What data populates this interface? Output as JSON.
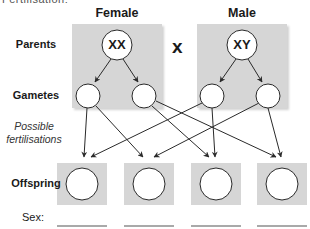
{
  "top_fragment": "Fertilisation:",
  "columns": {
    "female": "Female",
    "male": "Male"
  },
  "cross_symbol": "x",
  "rows": {
    "parents": "Parents",
    "gametes": "Gametes",
    "fertilisations_line1": "Possible",
    "fertilisations_line2": "fertilisations",
    "offspring": "Offspring",
    "sex": "Sex:"
  },
  "parents": {
    "female_genotype": "XX",
    "male_genotype": "XY"
  },
  "gametes": [
    {
      "id": "female-gamete-1",
      "label": ""
    },
    {
      "id": "female-gamete-2",
      "label": ""
    },
    {
      "id": "male-gamete-1",
      "label": ""
    },
    {
      "id": "male-gamete-2",
      "label": ""
    }
  ],
  "offspring": [
    {
      "id": "offspring-1",
      "label": "",
      "sex": ""
    },
    {
      "id": "offspring-2",
      "label": "",
      "sex": ""
    },
    {
      "id": "offspring-3",
      "label": "",
      "sex": ""
    },
    {
      "id": "offspring-4",
      "label": "",
      "sex": ""
    }
  ],
  "colors": {
    "panel_bg": "#d6d6d6",
    "circle_fill": "#ffffff",
    "stroke": "#2a2a2a",
    "text": "#1a1a1a"
  }
}
